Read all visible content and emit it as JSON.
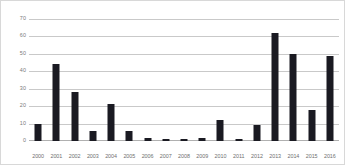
{
  "chart_data": {
    "type": "bar",
    "title": "",
    "subtitle": "",
    "xlabel": "",
    "ylabel": "",
    "categories": [
      "2000",
      "2001",
      "2002",
      "2003",
      "2004",
      "2005",
      "2006",
      "2007",
      "2008",
      "2009",
      "2010",
      "2011",
      "2012",
      "2013",
      "2014",
      "2015",
      "2016"
    ],
    "values": [
      10,
      44,
      28,
      6,
      21,
      6,
      2,
      1,
      1,
      2,
      12,
      1,
      9,
      62,
      50,
      18,
      49
    ],
    "series": [
      {
        "name": "",
        "values": [
          10,
          44,
          28,
          6,
          21,
          6,
          2,
          1,
          1,
          2,
          12,
          1,
          9,
          62,
          50,
          18,
          49
        ]
      }
    ],
    "ylim": [
      0,
      70
    ],
    "yticks": [
      0,
      10,
      20,
      30,
      40,
      50,
      60,
      70
    ],
    "ytick_labels": [
      "0",
      "10",
      "20",
      "30",
      "40",
      "50",
      "60",
      "70"
    ],
    "grid": true,
    "grid_axis": "y",
    "legend": false,
    "legend_position": "none",
    "bar_color": "#1a1a22",
    "gridline_color": "#c9c9c9",
    "axis_label_color": "#7a7a7a",
    "background_color": "#ffffff",
    "border_color": "#d8d8d8",
    "annotations": []
  }
}
